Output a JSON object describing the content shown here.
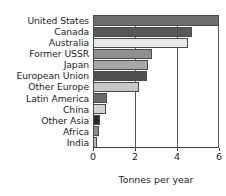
{
  "chart_data": {
    "type": "bar",
    "orientation": "horizontal",
    "title": "",
    "subtitle": "",
    "xlabel": "Tonnes per year",
    "ylabel": "",
    "xlim": [
      0,
      6
    ],
    "xticks": [
      0,
      2,
      4,
      6
    ],
    "xticklabels": [
      "0",
      "2",
      "4",
      "6"
    ],
    "grid": true,
    "grid_axis": "x",
    "legend": null,
    "legend_position": "none",
    "categories": [
      "United States",
      "Canada",
      "Australia",
      "Former USSR",
      "Japan",
      "European Union",
      "Other Europe",
      "Latin America",
      "China",
      "Other Asia",
      "Africa",
      "India"
    ],
    "values": [
      6.0,
      4.7,
      4.5,
      2.8,
      2.6,
      2.55,
      2.2,
      0.65,
      0.62,
      0.33,
      0.28,
      0.17
    ],
    "bar_colors": [
      "#6e6e6e",
      "#585858",
      "#e8e8e8",
      "#909090",
      "#a8a8a8",
      "#4e4e4e",
      "#c8c8c8",
      "#6a6a6a",
      "#d2d2d2",
      "#2a2a2a",
      "#8a8a8a",
      "#b6b6b6"
    ]
  },
  "axis": {
    "title": "Tonnes per year"
  },
  "style": {
    "text_color": "#1c1c1c",
    "axis_color": "#3a3a3a",
    "grid_color": "#5a5a5a",
    "background": "#ffffff",
    "bar_border": "#4a4a4a"
  }
}
